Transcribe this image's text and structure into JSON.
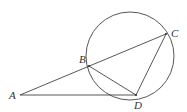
{
  "diagram": {
    "type": "geometry",
    "stroke_color": "#444444",
    "background": "#ffffff",
    "circle": {
      "cx": 130,
      "cy": 56,
      "r": 44
    },
    "points": {
      "A": {
        "label": "A",
        "x": 20,
        "y": 95,
        "lx": 9,
        "ly": 99
      },
      "B": {
        "label": "B",
        "x": 89,
        "y": 66,
        "lx": 79,
        "ly": 63
      },
      "C": {
        "label": "C",
        "x": 166,
        "y": 34,
        "lx": 171,
        "ly": 37
      },
      "D": {
        "label": "D",
        "x": 136,
        "y": 95,
        "lx": 134,
        "ly": 109
      }
    },
    "segments": [
      {
        "from": "A",
        "to": "C",
        "name": "secant-AC"
      },
      {
        "from": "A",
        "to": "D",
        "name": "tangent-AD"
      },
      {
        "from": "B",
        "to": "D",
        "name": "chord-BD"
      },
      {
        "from": "C",
        "to": "D",
        "name": "chord-CD"
      }
    ]
  }
}
